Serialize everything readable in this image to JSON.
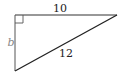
{
  "diagram": {
    "type": "right-triangle",
    "vertices": {
      "right_angle": [
        15,
        15
      ],
      "top_right": [
        117,
        15
      ],
      "bottom_left": [
        15,
        71
      ]
    },
    "labels": {
      "top_side": "10",
      "left_side": "b",
      "hypotenuse": "12"
    },
    "right_angle_marker": true,
    "colors": {
      "stroke": "#333333",
      "label": "#222222",
      "variable_label": "#888888"
    }
  }
}
